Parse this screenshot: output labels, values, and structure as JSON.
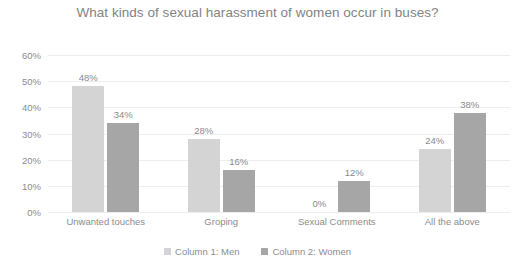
{
  "chart_data": {
    "type": "bar",
    "title": "What kinds of sexual harassment of women occur in buses?",
    "xlabel": "",
    "ylabel": "",
    "ylim": [
      0,
      60
    ],
    "ytick_labels": [
      "0%",
      "10%",
      "20%",
      "30%",
      "40%",
      "50%",
      "60%"
    ],
    "ytick_values": [
      0,
      10,
      20,
      30,
      40,
      50,
      60
    ],
    "grid": true,
    "legend_position": "bottom",
    "categories": [
      "Unwanted touches",
      "Groping",
      "Sexual Comments",
      "All the above"
    ],
    "series": [
      {
        "name": "Column 1: Men",
        "color": "#d4d4d4",
        "values": [
          48,
          28,
          0,
          24
        ],
        "labels": [
          "48%",
          "28%",
          "0%",
          "24%"
        ]
      },
      {
        "name": "Column 2: Women",
        "color": "#a6a6a6",
        "values": [
          34,
          16,
          12,
          38
        ],
        "labels": [
          "34%",
          "16%",
          "12%",
          "38%"
        ]
      }
    ]
  },
  "colors": {
    "background": "#ffffff",
    "text": "#8c8c8c",
    "title": "#838383",
    "gridline": "#ededed",
    "series_men": "#d4d4d4",
    "series_women": "#a6a6a6"
  }
}
